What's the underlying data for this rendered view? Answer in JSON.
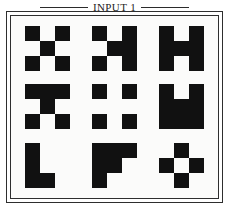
{
  "panel": {
    "caption": "INPUT 1",
    "background_color": "#fbfbfa",
    "ink_color": "#111111",
    "frame_color": "#2e2e2e"
  },
  "chart_data": {
    "type": "heatmap",
    "title": "INPUT 1",
    "subtitle": "",
    "xlabel": "",
    "ylabel": "",
    "grid": false,
    "legend": null,
    "cell_size_px": 15,
    "glyph_lattice": [
      3,
      3
    ],
    "layout": {
      "rows": 3,
      "cols": 3
    },
    "categories": [
      "r1c1",
      "r1c2",
      "r1c3",
      "r2c1",
      "r2c2",
      "r2c3",
      "r3c1",
      "r3c2",
      "r3c3"
    ],
    "values": [
      5,
      6,
      7,
      6,
      4,
      8,
      4,
      5,
      4
    ],
    "glyphs": [
      {
        "id": "r1c1",
        "row": 1,
        "col": 1,
        "name": "x-cross",
        "filled_count": 5,
        "matrix": [
          [
            1,
            0,
            1
          ],
          [
            0,
            1,
            0
          ],
          [
            1,
            0,
            1
          ]
        ]
      },
      {
        "id": "r1c2",
        "row": 1,
        "col": 2,
        "name": "broken-h",
        "filled_count": 6,
        "matrix": [
          [
            1,
            0,
            1
          ],
          [
            0,
            1,
            1
          ],
          [
            1,
            0,
            1
          ]
        ]
      },
      {
        "id": "r1c3",
        "row": 1,
        "col": 3,
        "name": "solid-h",
        "filled_count": 7,
        "matrix": [
          [
            1,
            0,
            1
          ],
          [
            1,
            1,
            1
          ],
          [
            1,
            0,
            1
          ]
        ]
      },
      {
        "id": "r2c1",
        "row": 2,
        "col": 1,
        "name": "t-with-feet",
        "filled_count": 6,
        "matrix": [
          [
            1,
            1,
            1
          ],
          [
            0,
            1,
            0
          ],
          [
            1,
            0,
            1
          ]
        ]
      },
      {
        "id": "r2c2",
        "row": 2,
        "col": 2,
        "name": "four-corners",
        "filled_count": 4,
        "matrix": [
          [
            1,
            0,
            1
          ],
          [
            0,
            0,
            0
          ],
          [
            1,
            0,
            1
          ]
        ]
      },
      {
        "id": "r2c3",
        "row": 2,
        "col": 3,
        "name": "solid-u",
        "filled_count": 8,
        "matrix": [
          [
            1,
            0,
            1
          ],
          [
            1,
            1,
            1
          ],
          [
            1,
            1,
            1
          ]
        ]
      },
      {
        "id": "r3c1",
        "row": 3,
        "col": 1,
        "name": "l-bar-with-dot",
        "filled_count": 4,
        "matrix": [
          [
            1,
            0,
            0
          ],
          [
            1,
            0,
            0
          ],
          [
            1,
            1,
            0
          ]
        ]
      },
      {
        "id": "r3c2",
        "row": 3,
        "col": 2,
        "name": "f-hook",
        "filled_count": 5,
        "matrix": [
          [
            1,
            1,
            1
          ],
          [
            1,
            1,
            0
          ],
          [
            1,
            0,
            0
          ]
        ]
      },
      {
        "id": "r3c3",
        "row": 3,
        "col": 3,
        "name": "hollow-plus",
        "filled_count": 4,
        "matrix": [
          [
            0,
            1,
            0
          ],
          [
            1,
            0,
            1
          ],
          [
            0,
            1,
            0
          ]
        ]
      }
    ]
  }
}
